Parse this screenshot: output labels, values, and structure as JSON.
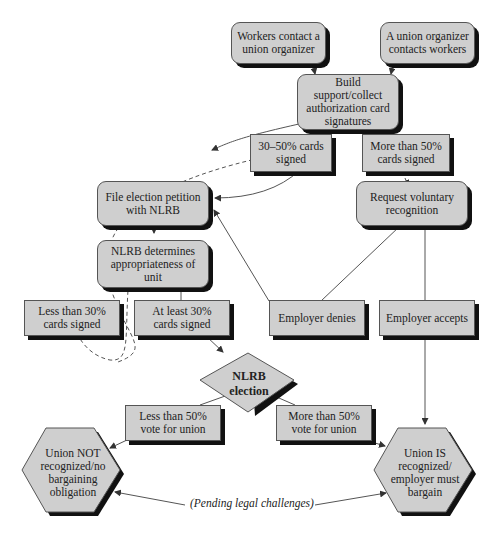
{
  "diagram": {
    "type": "flowchart",
    "topic": "Union organizing / NLRB recognition process",
    "nodes": {
      "workers_contact": "Workers contact a union organizer",
      "organizer_contacts": "A union organizer contacts workers",
      "build_support": "Build support/collect authorization card signatures",
      "cards_30_50": "30–50% cards signed",
      "cards_more_50": "More than 50% cards signed",
      "file_petition": "File election petition with NLRB",
      "request_voluntary": "Request voluntary recognition",
      "nlrb_determines": "NLRB determines appropriateness of unit",
      "less_30": "Less than 30% cards signed",
      "at_least_30": "At least 30% cards signed",
      "employer_denies": "Employer denies",
      "employer_accepts": "Employer accepts",
      "nlrb_election": "NLRB election",
      "less_50_vote": "Less than 50% vote for union",
      "more_50_vote": "More than 50% vote for union",
      "union_not": "Union NOT recognized/no bargaining obligation",
      "union_is": "Union IS recognized/ employer must bargain"
    },
    "annotation": "(Pending legal challenges)",
    "colors": {
      "box_fill": "#cfcfcf",
      "shadow": "#111111",
      "line": "#555555"
    }
  }
}
